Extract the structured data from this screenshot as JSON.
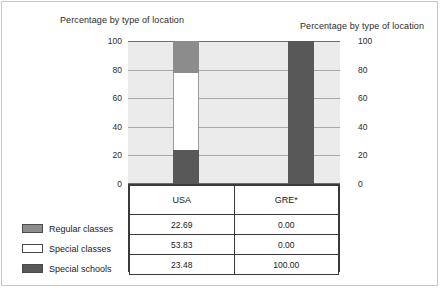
{
  "titles": {
    "left": "Percentage by type of location",
    "right": "Percentage by type of location"
  },
  "axis": {
    "ticks": [
      "100",
      "80",
      "60",
      "40",
      "20",
      "0"
    ]
  },
  "legend": {
    "items": [
      {
        "label": "Regular classes",
        "color": "#8c8c8c"
      },
      {
        "label": "Special classes",
        "color": "#ffffff"
      },
      {
        "label": "Special schools",
        "color": "#585858"
      }
    ]
  },
  "table": {
    "corner": "",
    "columns": [
      "USA",
      "GRE*"
    ],
    "rows": [
      {
        "label": "Regular classes",
        "usa": "22.69",
        "gre": "0.00"
      },
      {
        "label": "Special classes",
        "usa": "53.83",
        "gre": "0.00"
      },
      {
        "label": "Special schools",
        "usa": "23.48",
        "gre": "100.00"
      }
    ]
  },
  "chart_data": {
    "type": "bar",
    "subtype": "stacked-100",
    "title": "Percentage by type of location",
    "xlabel": "",
    "ylabel": "Percentage by type of location",
    "ylim": [
      0,
      100
    ],
    "yticks": [
      0,
      20,
      40,
      60,
      80,
      100
    ],
    "grid": true,
    "legend_position": "bottom-left",
    "dual_axis": true,
    "categories": [
      "USA",
      "GRE*"
    ],
    "series": [
      {
        "name": "Regular classes",
        "color": "#8c8c8c",
        "values": [
          22.69,
          0.0
        ]
      },
      {
        "name": "Special classes",
        "color": "#ffffff",
        "values": [
          53.83,
          0.0
        ]
      },
      {
        "name": "Special schools",
        "color": "#585858",
        "values": [
          23.48,
          100.0
        ]
      }
    ]
  }
}
